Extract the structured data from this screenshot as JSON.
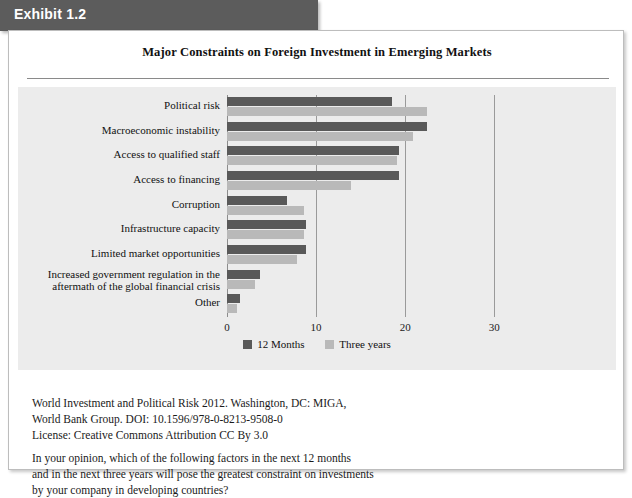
{
  "exhibit": {
    "banner_label": "Exhibit 1.2",
    "banner_color": "#5c5c5c"
  },
  "chart_title": "Major Constraints on Foreign Investment in Emerging Markets",
  "colors": {
    "series_12_months": "#595959",
    "series_three_years": "#b9b9b9",
    "plot_background": "#ececec",
    "gridline": "#9a9a9a",
    "card_background": "#ffffff"
  },
  "legend": {
    "position": "bottom-center",
    "items": [
      {
        "label": "12 Months",
        "color": "#595959"
      },
      {
        "label": "Three years",
        "color": "#b9b9b9"
      }
    ]
  },
  "chart_data": {
    "type": "bar",
    "orientation": "horizontal",
    "title": "Major Constraints on Foreign Investment in Emerging Markets",
    "xlabel": "",
    "ylabel": "",
    "xlim": [
      0,
      32
    ],
    "xticks": [
      0,
      10,
      20,
      30
    ],
    "xtick_labels": [
      "0",
      "10",
      "20",
      "30"
    ],
    "grid": true,
    "grid_axis": "x",
    "categories": [
      "Political risk",
      "Macroeconomic instability",
      "Access to qualified staff",
      "Access to financing",
      "Corruption",
      "Infrastructure capacity",
      "Limited market opportunities",
      "Increased government regulation in the aftermath of the global financial crisis",
      "Other"
    ],
    "series": [
      {
        "name": "12 Months",
        "color": "#595959",
        "values": [
          18.5,
          22.4,
          19.3,
          19.3,
          6.7,
          8.9,
          8.9,
          3.7,
          1.5
        ]
      },
      {
        "name": "Three years",
        "color": "#b9b9b9",
        "values": [
          22.5,
          20.9,
          19.1,
          13.9,
          8.7,
          8.7,
          7.9,
          3.1,
          1.1
        ]
      }
    ]
  },
  "source_lines": [
    "World Investment and Political Risk 2012. Washington, DC: MIGA,",
    "World Bank Group. DOI: 10.1596/978-0-8213-9508-0",
    "License: Creative Commons Attribution CC By 3.0"
  ],
  "question_lines": [
    "In your opinion, which of the following factors in the next 12 months",
    "and in the next three years will pose the greatest constraint on investments",
    "by your company in developing countries?"
  ]
}
